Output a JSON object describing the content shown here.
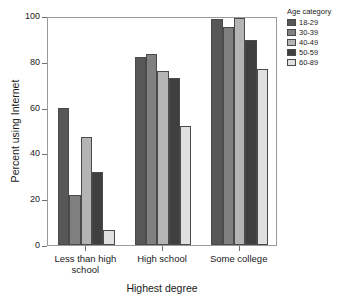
{
  "chart_data": {
    "type": "bar",
    "title": "",
    "xlabel": "Highest degree",
    "ylabel": "Percent using Internet",
    "ylim": [
      0,
      100
    ],
    "yticks": [
      0,
      20,
      40,
      60,
      80,
      100
    ],
    "grid": false,
    "legend_position": "right",
    "legend_title": "Age category",
    "categories": [
      "Less than high school",
      "High school",
      "Some college"
    ],
    "series": [
      {
        "name": "18-29",
        "color": "#575757",
        "values": [
          60,
          82,
          98.5
        ]
      },
      {
        "name": "30-39",
        "color": "#808080",
        "values": [
          22,
          83.5,
          95
        ]
      },
      {
        "name": "40-49",
        "color": "#b4b4b4",
        "values": [
          47,
          76,
          99
        ]
      },
      {
        "name": "50-59",
        "color": "#3f3f3f",
        "values": [
          32,
          73,
          89.5
        ]
      },
      {
        "name": "60-89",
        "color": "#e0e0e0",
        "values": [
          6.5,
          52,
          77
        ]
      }
    ]
  },
  "axis": {
    "y_tick_labels": [
      "0",
      "20",
      "40",
      "60",
      "80",
      "100"
    ],
    "x_tick_labels": [
      "Less than high\nschool",
      "High school",
      "Some college"
    ]
  }
}
